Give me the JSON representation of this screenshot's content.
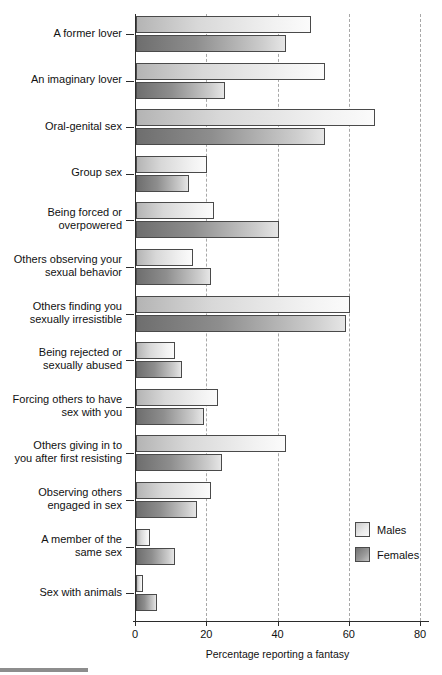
{
  "chart_data": {
    "type": "bar",
    "orientation": "horizontal",
    "title": "",
    "xlabel": "Percentage reporting a fantasy",
    "ylabel": "",
    "xlim": [
      0,
      80
    ],
    "xticks": [
      0,
      20,
      40,
      60,
      80
    ],
    "xtick_labels": [
      "0",
      "20",
      "40",
      "60",
      "80"
    ],
    "grid": true,
    "legend_position": "right-bottom",
    "categories": [
      "A former lover",
      "An imaginary lover",
      "Oral-genital sex",
      "Group sex",
      "Being forced or overpowered",
      "Others observing your sexual behavior",
      "Others finding you sexually irresistible",
      "Being rejected or sexually abused",
      "Forcing others to have sex with you",
      "Others giving in to you after first resisting",
      "Observing others engaged in sex",
      "A member of the same sex",
      "Sex with animals"
    ],
    "category_lines": [
      [
        "A former lover"
      ],
      [
        "An imaginary lover"
      ],
      [
        "Oral-genital sex"
      ],
      [
        "Group sex"
      ],
      [
        "Being forced or",
        "overpowered"
      ],
      [
        "Others observing your",
        "sexual behavior"
      ],
      [
        "Others finding you",
        "sexually irresistible"
      ],
      [
        "Being rejected or",
        "sexually abused"
      ],
      [
        "Forcing others to have",
        "sex with you"
      ],
      [
        "Others giving in to",
        "you after first resisting"
      ],
      [
        "Observing others",
        "engaged in sex"
      ],
      [
        "A member of the",
        "same sex"
      ],
      [
        "Sex with animals"
      ]
    ],
    "series": [
      {
        "name": "Males",
        "color": "#e8e8e8",
        "values": [
          49,
          53,
          67,
          20,
          22,
          16,
          60,
          11,
          23,
          42,
          21,
          4,
          2
        ]
      },
      {
        "name": "Females",
        "color": "#8a8a8a",
        "values": [
          42,
          25,
          53,
          15,
          40,
          21,
          59,
          13,
          19,
          24,
          17,
          11,
          6
        ]
      }
    ]
  },
  "legend": {
    "items": [
      {
        "label": "Males",
        "swatch": "males"
      },
      {
        "label": "Females",
        "swatch": "females"
      }
    ]
  }
}
